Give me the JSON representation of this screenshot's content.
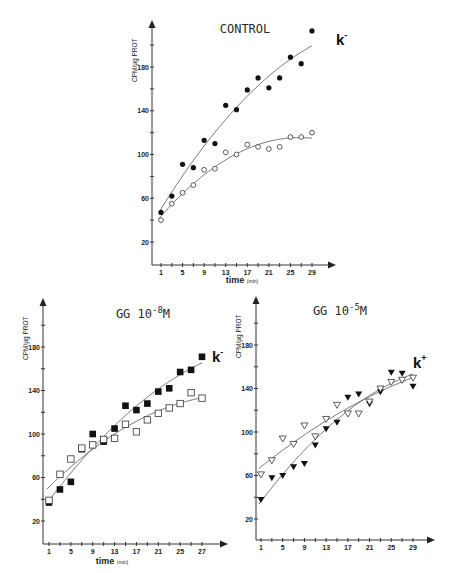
{
  "chart_data": [
    {
      "type": "scatter",
      "id": "control",
      "title": "CONTROL",
      "xlabel": "time",
      "xlabel_unit": "(min)",
      "ylabel": "CPM/µg PROT",
      "xlim": [
        0,
        32
      ],
      "ylim": [
        0,
        210
      ],
      "xticks": [
        1,
        3,
        5,
        7,
        9,
        11,
        13,
        15,
        17,
        19,
        21,
        23,
        25,
        27,
        29
      ],
      "xtick_labels": [
        "1",
        "5",
        "9",
        "13",
        "17",
        "21",
        "25",
        "29"
      ],
      "xtick_label_values": [
        1,
        5,
        9,
        13,
        17,
        21,
        25,
        29
      ],
      "yticks": [
        20,
        40,
        60,
        80,
        100,
        120,
        140,
        160,
        180,
        200
      ],
      "ytick_labels": [
        "20",
        "60",
        "100",
        "140",
        "180"
      ],
      "ytick_label_values": [
        20,
        60,
        100,
        140,
        180
      ],
      "curve_label": "k",
      "curve_label_sup": "-",
      "series": [
        {
          "name": "filled circles",
          "marker": "circle-filled",
          "x": [
            1,
            3,
            5,
            7,
            9,
            11,
            13,
            15,
            17,
            19,
            21,
            23,
            25,
            27,
            29
          ],
          "y": [
            47,
            62,
            91,
            88,
            113,
            110,
            145,
            141,
            159,
            170,
            161,
            170,
            189,
            183,
            213
          ],
          "fit": [
            48,
            168,
            205
          ]
        },
        {
          "name": "open circles",
          "marker": "circle-open",
          "x": [
            1,
            3,
            5,
            7,
            9,
            11,
            13,
            15,
            17,
            19,
            21,
            23,
            25,
            27,
            29
          ],
          "y": [
            40,
            55,
            65,
            72,
            86,
            87,
            102,
            100,
            109,
            107,
            105,
            107,
            116,
            116,
            120
          ],
          "fit": [
            42,
            118,
            null
          ]
        }
      ]
    },
    {
      "type": "scatter",
      "id": "gg-1e-8",
      "title": "GG 10",
      "title_exp": "-8",
      "title_unit": "M",
      "xlabel": "time",
      "xlabel_unit": "(min)",
      "ylabel": "CPM/µg PROT",
      "xlim": [
        0,
        32
      ],
      "ylim": [
        0,
        210
      ],
      "xticks": [
        1,
        3,
        5,
        7,
        9,
        11,
        13,
        15,
        17,
        19,
        21,
        23,
        25,
        27,
        29
      ],
      "xtick_labels": [
        "1",
        "5",
        "9",
        "13",
        "17",
        "21",
        "25",
        "27"
      ],
      "xtick_label_values": [
        1,
        5,
        9,
        13,
        17,
        21,
        25,
        29
      ],
      "yticks": [
        20,
        40,
        60,
        80,
        100,
        120,
        140,
        160,
        180,
        200
      ],
      "ytick_labels": [
        "20",
        "60",
        "100",
        "140",
        "180"
      ],
      "ytick_label_values": [
        20,
        60,
        100,
        140,
        180
      ],
      "curve_label": "k",
      "curve_label_sup": "-",
      "series": [
        {
          "name": "filled squares",
          "marker": "square-filled",
          "x": [
            1,
            3,
            5,
            7,
            9,
            11,
            13,
            15,
            17,
            19,
            21,
            23,
            25,
            27,
            29
          ],
          "y": [
            37,
            49,
            56,
            86,
            100,
            93,
            105,
            126,
            122,
            128,
            139,
            142,
            157,
            159,
            171
          ],
          "fit": [
            40,
            168,
            null
          ]
        },
        {
          "name": "open squares",
          "marker": "square-open",
          "x": [
            1,
            3,
            5,
            7,
            9,
            11,
            13,
            15,
            17,
            19,
            21,
            23,
            25,
            27,
            29
          ],
          "y": [
            39,
            63,
            77,
            87,
            90,
            95,
            96,
            109,
            102,
            113,
            119,
            124,
            128,
            138,
            133
          ],
          "fit": [
            42,
            136,
            null
          ]
        }
      ]
    },
    {
      "type": "scatter",
      "id": "gg-1e-5",
      "title": "GG 10",
      "title_exp": "-5",
      "title_unit": "M",
      "xlabel": "time",
      "xlabel_unit": "(min)",
      "ylabel": "CPM/µg PROT",
      "xlim": [
        0,
        32
      ],
      "ylim": [
        0,
        210
      ],
      "xticks": [
        1,
        3,
        5,
        7,
        9,
        11,
        13,
        15,
        17,
        19,
        21,
        23,
        25,
        27,
        29
      ],
      "xtick_labels": [
        "1",
        "5",
        "9",
        "13",
        "17",
        "21",
        "25",
        "29"
      ],
      "xtick_label_values": [
        1,
        5,
        9,
        13,
        17,
        21,
        25,
        29
      ],
      "yticks": [
        20,
        40,
        60,
        80,
        100,
        120,
        140,
        160,
        180,
        200
      ],
      "ytick_labels": [
        "20",
        "60",
        "100",
        "140",
        "180"
      ],
      "ytick_label_values": [
        20,
        60,
        100,
        140,
        180
      ],
      "curve_label": "k",
      "curve_label_sup": "+",
      "series": [
        {
          "name": "filled triangles",
          "marker": "triangle-filled",
          "x": [
            1,
            3,
            5,
            7,
            9,
            11,
            13,
            15,
            17,
            19,
            21,
            23,
            25,
            27,
            29
          ],
          "y": [
            38,
            58,
            60,
            68,
            71,
            88,
            103,
            109,
            132,
            135,
            126,
            137,
            155,
            154,
            142
          ],
          "fit": [
            40,
            152,
            null
          ]
        },
        {
          "name": "open triangles",
          "marker": "triangle-open",
          "x": [
            1,
            3,
            5,
            7,
            9,
            11,
            13,
            15,
            17,
            19,
            21,
            23,
            25,
            27,
            29
          ],
          "y": [
            61,
            74,
            94,
            89,
            106,
            96,
            112,
            125,
            117,
            117,
            128,
            140,
            146,
            148,
            150
          ],
          "fit": [
            60,
            148,
            null
          ]
        }
      ]
    }
  ]
}
